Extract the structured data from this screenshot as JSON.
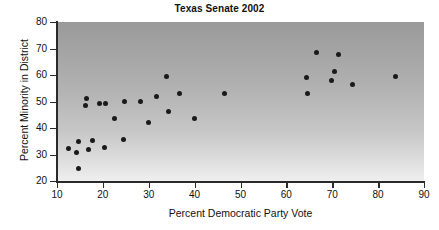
{
  "chart_data": {
    "type": "scatter",
    "title": "Texas Senate 2002",
    "xlabel": "Percent Democratic Party Vote",
    "ylabel": "Percent Minority in District",
    "xlim": [
      10,
      90
    ],
    "ylim": [
      20,
      80
    ],
    "xticks": [
      10,
      20,
      30,
      40,
      50,
      60,
      70,
      80,
      90
    ],
    "yticks": [
      20,
      30,
      40,
      50,
      60,
      70,
      80
    ],
    "grid": false,
    "legend": null,
    "marker": {
      "shape": "circle",
      "color": "#1a1a1a",
      "size_px": 5
    },
    "background": {
      "type": "vertical-gradient",
      "top": "#9a9a9a",
      "bottom": "#efefef"
    },
    "points": [
      {
        "x": 12.4,
        "y": 32.2
      },
      {
        "x": 14.3,
        "y": 30.9
      },
      {
        "x": 14.6,
        "y": 34.8
      },
      {
        "x": 14.6,
        "y": 24.8
      },
      {
        "x": 16.2,
        "y": 48.6
      },
      {
        "x": 16.5,
        "y": 51.1
      },
      {
        "x": 16.8,
        "y": 32.0
      },
      {
        "x": 17.8,
        "y": 35.4
      },
      {
        "x": 19.3,
        "y": 49.4
      },
      {
        "x": 20.3,
        "y": 32.6
      },
      {
        "x": 20.5,
        "y": 49.3
      },
      {
        "x": 22.6,
        "y": 43.7
      },
      {
        "x": 24.4,
        "y": 35.5
      },
      {
        "x": 24.8,
        "y": 50.1
      },
      {
        "x": 28.3,
        "y": 49.9
      },
      {
        "x": 30.0,
        "y": 42.0
      },
      {
        "x": 31.6,
        "y": 51.7
      },
      {
        "x": 33.8,
        "y": 59.4
      },
      {
        "x": 34.3,
        "y": 46.1
      },
      {
        "x": 36.6,
        "y": 53.1
      },
      {
        "x": 39.9,
        "y": 43.4
      },
      {
        "x": 46.6,
        "y": 52.9
      },
      {
        "x": 64.3,
        "y": 58.9
      },
      {
        "x": 64.7,
        "y": 52.9
      },
      {
        "x": 66.5,
        "y": 68.4
      },
      {
        "x": 69.8,
        "y": 57.9
      },
      {
        "x": 70.4,
        "y": 61.5
      },
      {
        "x": 71.4,
        "y": 67.9
      },
      {
        "x": 74.4,
        "y": 56.4
      },
      {
        "x": 83.8,
        "y": 59.5
      }
    ]
  }
}
